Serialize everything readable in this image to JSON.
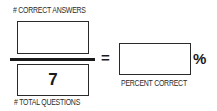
{
  "labels": {
    "numerator": "# CORRECT ANSWERS",
    "denominator": "# TOTAL QUESTIONS",
    "result": "PERCENT CORRECT"
  },
  "values": {
    "numerator": "",
    "denominator": "7",
    "result": ""
  },
  "symbols": {
    "equals": "=",
    "percent": "%"
  }
}
